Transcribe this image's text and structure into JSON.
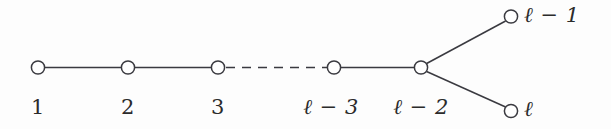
{
  "figure": {
    "kind": "dynkin-diagram",
    "family": "D_l",
    "background_color": "#fdfdfd",
    "stroke_color": "#3a3a40",
    "node_fill": "#ffffff",
    "node_radius": 6.5,
    "stroke_width": 1.4
  },
  "nodes": [
    {
      "id": "n1",
      "label": "1",
      "cx": 38,
      "cy": 67.5,
      "label_x": 38,
      "label_y": 97
    },
    {
      "id": "n2",
      "label": "2",
      "cx": 128,
      "cy": 67.5,
      "label_x": 128,
      "label_y": 97
    },
    {
      "id": "n3",
      "label": "3",
      "cx": 218,
      "cy": 67.5,
      "label_x": 218,
      "label_y": 97
    },
    {
      "id": "nl3",
      "label": "ℓ − 3",
      "cx": 334,
      "cy": 67.5,
      "label_x": 331,
      "label_y": 97
    },
    {
      "id": "nl2",
      "label": "ℓ − 2",
      "cx": 421,
      "cy": 67.5,
      "label_x": 421,
      "label_y": 97
    },
    {
      "id": "nl1",
      "label": "ℓ − 1",
      "cx": 511,
      "cy": 16.5,
      "label_x": 526,
      "label_y": 6
    },
    {
      "id": "nl",
      "label": "ℓ",
      "cx": 511,
      "cy": 111,
      "label_x": 526,
      "label_y": 100
    }
  ],
  "edges": [
    {
      "from": "n1",
      "to": "n2",
      "style": "solid"
    },
    {
      "from": "n2",
      "to": "n3",
      "style": "solid"
    },
    {
      "from": "n3",
      "to": "nl3",
      "style": "dashed"
    },
    {
      "from": "nl3",
      "to": "nl2",
      "style": "solid"
    },
    {
      "from": "nl2",
      "to": "nl1",
      "style": "solid"
    },
    {
      "from": "nl2",
      "to": "nl",
      "style": "solid"
    }
  ],
  "labels": {
    "l1": "1",
    "l2": "2",
    "l3": "3",
    "l_minus_3": "ℓ − 3",
    "l_minus_2": "ℓ − 2",
    "l_minus_1": "ℓ − 1",
    "l": "ℓ"
  }
}
